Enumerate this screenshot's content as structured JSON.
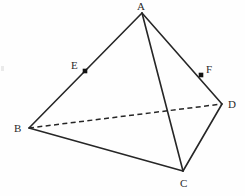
{
  "figure": {
    "background_color": "#fefefe",
    "stroke_color": "#262626",
    "marker_color": "#131313",
    "label_color": "#2b2b2b",
    "canvas": {
      "width": 245,
      "height": 196
    }
  },
  "vertices": [
    {
      "id": "A",
      "label": "A",
      "x": 142,
      "y": 13,
      "label_x": 137,
      "label_y": 1,
      "kind": "apex"
    },
    {
      "id": "B",
      "label": "B",
      "x": 29,
      "y": 128,
      "label_x": 14,
      "label_y": 123,
      "kind": "base"
    },
    {
      "id": "C",
      "label": "C",
      "x": 183,
      "y": 171,
      "label_x": 180,
      "label_y": 178,
      "kind": "base"
    },
    {
      "id": "D",
      "label": "D",
      "x": 222,
      "y": 104,
      "label_x": 228,
      "label_y": 99,
      "kind": "base"
    }
  ],
  "points": [
    {
      "id": "E",
      "label": "E",
      "x": 85,
      "y": 71,
      "label_x": 71,
      "label_y": 60,
      "on_edge": "AB",
      "marker": "filled-square",
      "marker_size": 4.6
    },
    {
      "id": "F",
      "label": "F",
      "x": 201,
      "y": 75,
      "label_x": 206,
      "label_y": 64,
      "on_edge": "AD",
      "marker": "filled-square",
      "marker_size": 4.6
    }
  ],
  "edges": [
    {
      "id": "AB",
      "from": "A",
      "to": "B",
      "style": "solid",
      "x1": 142,
      "y1": 13,
      "x2": 29,
      "y2": 128
    },
    {
      "id": "AC",
      "from": "A",
      "to": "C",
      "style": "solid",
      "x1": 142,
      "y1": 13,
      "x2": 183,
      "y2": 171
    },
    {
      "id": "AD",
      "from": "A",
      "to": "D",
      "style": "solid",
      "x1": 142,
      "y1": 13,
      "x2": 222,
      "y2": 104
    },
    {
      "id": "BC",
      "from": "B",
      "to": "C",
      "style": "solid",
      "x1": 29,
      "y1": 128,
      "x2": 183,
      "y2": 171
    },
    {
      "id": "CD",
      "from": "C",
      "to": "D",
      "style": "solid",
      "x1": 183,
      "y1": 171,
      "x2": 222,
      "y2": 104
    },
    {
      "id": "BD",
      "from": "B",
      "to": "D",
      "style": "dashed",
      "x1": 29,
      "y1": 128,
      "x2": 222,
      "y2": 104
    }
  ],
  "artifact": {
    "x": 1,
    "y": 66
  }
}
